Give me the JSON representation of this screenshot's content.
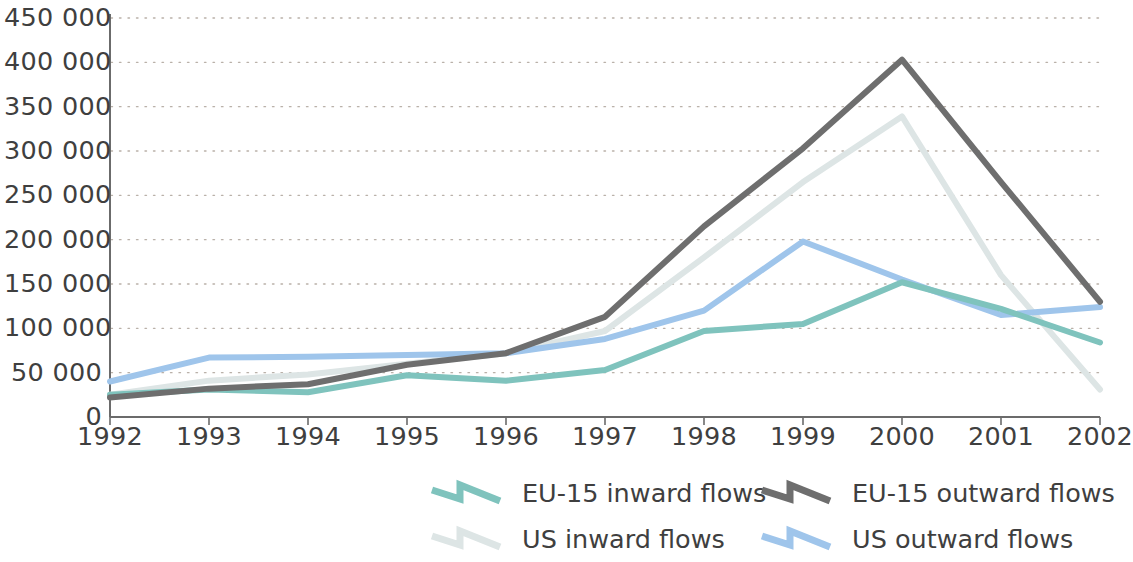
{
  "chart_data": {
    "type": "line",
    "title": "",
    "subtitle": "",
    "xlabel": "",
    "ylabel": "",
    "x": [
      "1992",
      "1993",
      "1994",
      "1995",
      "1996",
      "1997",
      "1998",
      "1999",
      "2000",
      "2001",
      "2002"
    ],
    "categories": [
      "1992",
      "1993",
      "1994",
      "1995",
      "1996",
      "1997",
      "1998",
      "1999",
      "2000",
      "2001",
      "2002"
    ],
    "xlim": [
      "1992",
      "2002"
    ],
    "ylim": [
      0,
      450000
    ],
    "ytick_values": [
      0,
      50000,
      100000,
      150000,
      200000,
      250000,
      300000,
      350000,
      400000,
      450000
    ],
    "ytick_labels": [
      "0",
      "50 000",
      "100 000",
      "150 000",
      "200 000",
      "250 000",
      "300 000",
      "350 000",
      "400 000",
      "450 000"
    ],
    "xtick_labels": [
      "1992",
      "1993",
      "1994",
      "1995",
      "1996",
      "1997",
      "1998",
      "1999",
      "2000",
      "2001",
      "2002"
    ],
    "grid": true,
    "grid_style": "dotted-horizontal",
    "legend_position": "bottom",
    "series": [
      {
        "name": "EU-15 inward flows",
        "color": "#7fc3bd",
        "values": [
          25000,
          31000,
          28000,
          47000,
          41000,
          53000,
          97000,
          105000,
          152000,
          122000,
          84000
        ]
      },
      {
        "name": "EU-15 outward flows",
        "color": "#6e6e6e",
        "values": [
          22000,
          32000,
          37000,
          59000,
          72000,
          113000,
          215000,
          303000,
          403000,
          265000,
          130000
        ]
      },
      {
        "name": "US inward flows",
        "color": "#dde5e5",
        "values": [
          25000,
          41000,
          48000,
          60000,
          72000,
          97000,
          180000,
          265000,
          339000,
          160000,
          31000
        ]
      },
      {
        "name": "US outward flows",
        "color": "#9fc5eb",
        "values": [
          40000,
          67000,
          68000,
          70000,
          72000,
          88000,
          120000,
          198000,
          155000,
          115000,
          124000
        ]
      }
    ]
  },
  "axes": {
    "y_labels": [
      "450 000",
      "400 000",
      "350 000",
      "300 000",
      "250 000",
      "200 000",
      "150 000",
      "100 000",
      "50 000",
      "0"
    ],
    "x_labels": [
      "1992",
      "1993",
      "1994",
      "1995",
      "1996",
      "1997",
      "1998",
      "1999",
      "2000",
      "2001",
      "2002"
    ]
  },
  "legend": {
    "items": [
      {
        "label": "EU-15 inward flows",
        "color": "#7fc3bd"
      },
      {
        "label": "EU-15 outward flows",
        "color": "#6e6e6e"
      },
      {
        "label": "US inward flows",
        "color": "#dde5e5"
      },
      {
        "label": "US outward flows",
        "color": "#9fc5eb"
      }
    ]
  },
  "colors": {
    "axis_line": "#6b6b6b",
    "grid_dot": "#b9b0a8",
    "text": "#3f3f3f",
    "background": "#ffffff"
  }
}
